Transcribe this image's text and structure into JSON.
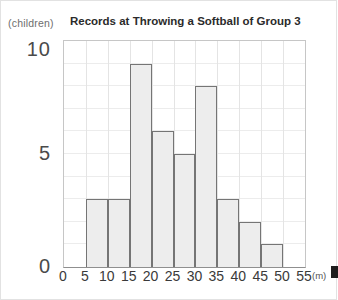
{
  "chart": {
    "title": "Records at Throwing a Softball of Group 3",
    "y_unit": "(children)",
    "x_unit": "(m)"
  },
  "chart_data": {
    "type": "bar",
    "title": "Records at Throwing a Softball of Group 3",
    "xlabel": "(m)",
    "ylabel": "(children)",
    "bins": [
      "5-10",
      "10-15",
      "15-20",
      "20-25",
      "25-30",
      "30-35",
      "35-40",
      "40-45",
      "45-50"
    ],
    "bin_starts": [
      5,
      10,
      15,
      20,
      25,
      30,
      35,
      40,
      45
    ],
    "bin_width": 5,
    "values": [
      3,
      3,
      9,
      6,
      5,
      8,
      3,
      2,
      1
    ],
    "xlim": [
      0,
      55
    ],
    "ylim": [
      0,
      10
    ],
    "x_ticks": [
      0,
      5,
      10,
      15,
      20,
      25,
      30,
      35,
      40,
      45,
      50,
      55
    ],
    "y_ticks": [
      0,
      5,
      10
    ],
    "grid": true,
    "grid_x_step": 5,
    "grid_y_step": 1,
    "legend": false,
    "colors": {
      "bar_fill": "#ededed",
      "bar_border": "#757575",
      "grid_line_h": "#ececec",
      "grid_line_v": "#e4e4e4",
      "plot_border": "#c6c6c6",
      "axis_line": "#8f8f8f",
      "x_tick_text": "#3a3a3a",
      "y_tick_text": "#4a4a4a",
      "title_text": "#2b2b2b",
      "unit_text": "#6e6e6e"
    }
  }
}
